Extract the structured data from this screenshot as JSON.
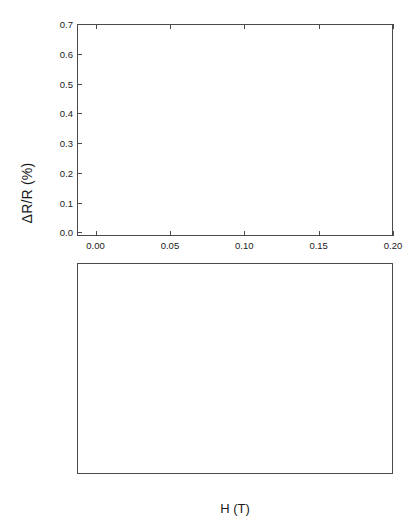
{
  "figure": {
    "xlabel": "H (T)",
    "ylabel": "ΔR/R (%)"
  },
  "chart_data": [
    {
      "type": "scatter",
      "panel": "top",
      "title": "",
      "xlabel": "H (T)",
      "ylabel": "ΔR/R (%)",
      "xlim": [
        -0.0125,
        0.2
      ],
      "ylim": [
        -0.012,
        0.7
      ],
      "xticks": [
        0.0,
        0.05,
        0.1,
        0.15,
        0.2
      ],
      "xticklabels": [
        "0.00",
        "0.05",
        "0.10",
        "0.15",
        "0.20"
      ],
      "yticks": [
        0.0,
        0.1,
        0.2,
        0.3,
        0.4,
        0.5,
        0.6,
        0.7
      ],
      "yticklabels": [
        "0.0",
        "0.1",
        "0.2",
        "0.3",
        "0.4",
        "0.5",
        "0.6",
        "0.7"
      ],
      "grid": false,
      "legend_title": "T (K)",
      "legend_position": "upper-left-inside",
      "series": [
        {
          "name": ".285",
          "marker": "open-circle",
          "x_end": 0.2,
          "y_end": 0.645,
          "y_at_neg": 0.205,
          "curvature": 0.55
        },
        {
          "name": ".320",
          "marker": "filled-square",
          "x_end": 0.2,
          "y_end": 0.558,
          "y_at_neg": 0.185,
          "curvature": 0.55
        },
        {
          "name": ".382",
          "marker": "open-triangle-up",
          "x_end": 0.2,
          "y_end": 0.487,
          "y_at_neg": 0.168,
          "curvature": 0.56
        },
        {
          "name": ".459",
          "marker": "filled-diamond",
          "x_end": 0.2,
          "y_end": 0.425,
          "y_at_neg": 0.15,
          "curvature": 0.57
        },
        {
          "name": ".625",
          "marker": "open-triangle-dn",
          "x_end": 0.2,
          "y_end": 0.395,
          "y_at_neg": 0.135,
          "curvature": 0.58
        },
        {
          "name": ".850",
          "marker": "filled-circle",
          "x_end": 0.2,
          "y_end": 0.372,
          "y_at_neg": 0.12,
          "curvature": 0.59
        },
        {
          "name": "1.047",
          "marker": "open-square",
          "x_end": 0.2,
          "y_end": 0.352,
          "y_at_neg": 0.108,
          "curvature": 0.6
        },
        {
          "name": "1.32",
          "marker": "filled-triangle-up",
          "x_end": 0.2,
          "y_end": 0.34,
          "y_at_neg": 0.096,
          "curvature": 0.61
        },
        {
          "name": "1.785",
          "marker": "open-diamond",
          "x_end": 0.2,
          "y_end": 0.332,
          "y_at_neg": 0.082,
          "curvature": 0.62
        },
        {
          "name": "2.315",
          "marker": "filled-triangle-dn",
          "x_end": 0.2,
          "y_end": 0.29,
          "y_at_neg": 0.068,
          "curvature": 0.63
        },
        {
          "name": "3.30",
          "marker": "open-hexagon",
          "x_end": 0.2,
          "y_end": 0.225,
          "y_at_neg": 0.05,
          "curvature": 0.66
        },
        {
          "name": "4.30",
          "marker": "cross-x",
          "x_end": 0.2,
          "y_end": 0.147,
          "y_at_neg": 0.032,
          "curvature": 0.72
        },
        {
          "name": "7.30",
          "marker": "filled-square",
          "x_end": 0.2,
          "y_end": 0.021,
          "y_at_neg": 0.01,
          "curvature": 0.9
        },
        {
          "name": "9.80",
          "marker": "filled-hexagon",
          "x_end": 0.188,
          "y_end": -0.008,
          "y_at_neg": 0.006,
          "curvature": 1.1
        }
      ]
    },
    {
      "type": "scatter",
      "panel": "bottom",
      "title": "",
      "xlabel": "H (T)",
      "ylabel": "ΔR/R (%)",
      "xlim": [
        -0.022,
        0.102
      ],
      "ylim": [
        -1.45,
        0.04
      ],
      "xticks": [
        -0.02,
        0.0,
        0.02,
        0.04,
        0.06,
        0.08,
        0.1
      ],
      "xticklabels": [
        "-0.02",
        "0.00",
        "0.02",
        "0.04",
        "0.06",
        "0.08",
        "0.10"
      ],
      "yticks": [
        0.0,
        -0.2,
        -0.4,
        -0.6,
        -0.8,
        -1.0,
        -1.2,
        -1.4
      ],
      "yticklabels": [
        "0.0",
        "-0.2",
        "-0.4",
        "-0.6",
        "-0.8",
        "-1.0",
        "-1.2",
        "-1.4"
      ],
      "grid": false,
      "legend_title": "T (K)",
      "legend_position": "lower-left-inside",
      "series": [
        {
          "name": "0.43",
          "marker": "open-circle",
          "y_end_right": -1.4,
          "y_end_left": -1.36,
          "curvature": 0.68
        },
        {
          "name": "0.89",
          "marker": "filled-triangle-up",
          "y_end_right": -1.33,
          "y_end_left": -1.3,
          "curvature": 0.68
        },
        {
          "name": "1.17",
          "marker": "open-square",
          "y_end_right": -1.12,
          "y_end_left": -1.02,
          "curvature": 0.7
        },
        {
          "name": "2.31",
          "marker": "filled-diamond",
          "y_end_right": -0.7,
          "y_end_left": -0.62,
          "curvature": 0.72
        },
        {
          "name": "3.40",
          "marker": "open-triangle-dn",
          "y_end_right": -0.55,
          "y_end_left": -0.48,
          "curvature": 0.74
        },
        {
          "name": "3.98",
          "marker": "filled-triangle-dn",
          "y_end_right": -0.51,
          "y_end_left": -0.44,
          "curvature": 0.74
        },
        {
          "name": "5.60",
          "marker": "filled-square",
          "y_end_right": -0.4,
          "y_end_left": -0.35,
          "curvature": 0.76
        },
        {
          "name": "8.50",
          "marker": "open-circle-sm",
          "y_end_right": -0.36,
          "y_end_left": -0.31,
          "curvature": 0.78
        },
        {
          "name": "12.6",
          "marker": "filled-circle",
          "y_end_right": -0.28,
          "y_end_left": -0.24,
          "curvature": 0.8
        },
        {
          "name": "16.2",
          "marker": "open-triangle-up",
          "y_end_right": -0.22,
          "y_end_left": -0.18,
          "curvature": 0.82
        }
      ]
    }
  ]
}
